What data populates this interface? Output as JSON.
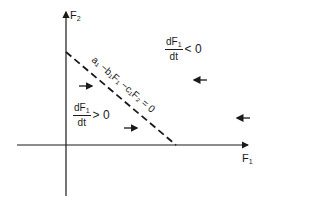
{
  "axes": {
    "x_label": "F",
    "x_label_sub": "1",
    "y_label": "F",
    "y_label_sub": "2"
  },
  "isocline": {
    "equation": "a₁ −b₁F₁ −c₁F₂ = 0",
    "style": "dashed"
  },
  "regions": {
    "upper": {
      "num": "dF",
      "num_sub": "1",
      "den": "dt",
      "relation": "< 0"
    },
    "lower": {
      "num": "dF",
      "num_sub": "1",
      "den": "dt",
      "relation": "> 0"
    }
  },
  "arrows": [
    {
      "direction": "right",
      "x": 85,
      "y": 86
    },
    {
      "direction": "right",
      "x": 130,
      "y": 128
    },
    {
      "direction": "left",
      "x": 200,
      "y": 80
    },
    {
      "direction": "left",
      "x": 243,
      "y": 118
    }
  ],
  "colors": {
    "ink": "#1a1a1a",
    "background": "#ffffff"
  }
}
